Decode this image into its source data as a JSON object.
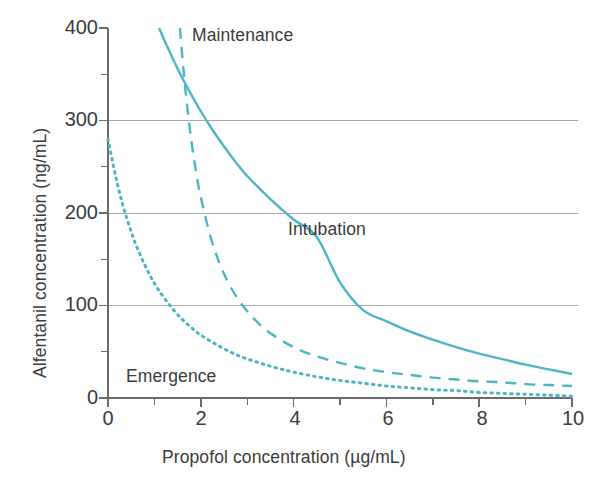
{
  "chart_data": {
    "type": "line",
    "title": "",
    "xlabel": "Propofol concentration  (µg/mL)",
    "ylabel": "Alfentanil concentration  (ng/mL)",
    "xlim": [
      0,
      10
    ],
    "ylim": [
      0,
      400
    ],
    "xticks": [
      0,
      2,
      4,
      6,
      8,
      10
    ],
    "xtick_labels": [
      "0",
      "2",
      "4",
      "6",
      "8",
      "10"
    ],
    "xminor_ticks": [
      1,
      3,
      5,
      7,
      9
    ],
    "yticks": [
      0,
      100,
      200,
      300,
      400
    ],
    "ytick_labels": [
      "0",
      "100",
      "200",
      "300",
      "400"
    ],
    "yminor_ticks": [
      50,
      150,
      250,
      350
    ],
    "gridlines_y": [
      100,
      200,
      300
    ],
    "grid": "horizontal-major-only",
    "legend": "inline-curve-labels",
    "line_color": "#4db5c4",
    "grid_color": "#a8a8a8",
    "axis_color": "#6b6b6b",
    "text_color": "#3b3b3b",
    "series": [
      {
        "name": "Maintenance",
        "style": "dashed",
        "label_x": 2.05,
        "label_y": 385,
        "x": [
          1.55,
          1.6,
          1.65,
          1.7,
          1.8,
          1.9,
          2.0,
          2.2,
          2.4,
          2.6,
          2.8,
          3.0,
          3.2,
          3.5,
          4.0,
          4.5,
          5.0,
          5.5,
          6.0,
          6.5,
          7.0,
          7.5,
          8.0,
          8.5,
          9.0,
          9.5,
          10.0
        ],
        "y": [
          400,
          370,
          343,
          318,
          277,
          244,
          217,
          176,
          146,
          124,
          107,
          94,
          83,
          70,
          55,
          45,
          38,
          32,
          28,
          25,
          22,
          20,
          18,
          17,
          15,
          14,
          13
        ]
      },
      {
        "name": "Intubation",
        "style": "solid",
        "label_x": 4.0,
        "label_y": 185,
        "x": [
          1.1,
          1.25,
          1.5,
          1.75,
          2.0,
          2.25,
          2.5,
          2.75,
          3.0,
          3.5,
          4.0,
          4.5,
          5.0,
          5.5,
          6.0,
          6.5,
          7.0,
          7.5,
          8.0,
          8.5,
          9.0,
          9.5,
          10.0
        ],
        "y": [
          400,
          383,
          356,
          332,
          310,
          290,
          272,
          255,
          240,
          215,
          193,
          174,
          125,
          95,
          83,
          72,
          63,
          55,
          48,
          42,
          36,
          31,
          26
        ]
      },
      {
        "name": "Emergence",
        "style": "dotted",
        "label_x": 0.55,
        "label_y": 28,
        "x": [
          0.0,
          0.1,
          0.2,
          0.3,
          0.4,
          0.5,
          0.6,
          0.8,
          1.0,
          1.2,
          1.4,
          1.6,
          1.8,
          2.0,
          2.4,
          2.8,
          3.2,
          3.6,
          4.0,
          4.5,
          5.0,
          5.5,
          6.0,
          6.5,
          7.0,
          7.5,
          8.0,
          8.5,
          9.0,
          9.5,
          10.0
        ],
        "y": [
          280,
          255,
          232,
          212,
          195,
          180,
          166,
          143,
          124,
          109,
          96,
          85,
          76,
          68,
          56,
          46,
          39,
          33,
          28,
          23,
          19,
          16,
          13,
          11,
          9,
          8,
          6,
          5,
          4,
          3,
          2
        ]
      }
    ]
  },
  "curve_labels": {
    "maintenance": "Maintenance",
    "intubation": "Intubation",
    "emergence": "Emergence"
  },
  "axis_titles": {
    "y": "Alfentanil concentration  (ng/mL)",
    "x": "Propofol concentration  (µg/mL)"
  },
  "tick_labels": {
    "y": [
      "400",
      "300",
      "200",
      "100",
      "0"
    ],
    "x": [
      "0",
      "2",
      "4",
      "6",
      "8",
      "10"
    ]
  }
}
